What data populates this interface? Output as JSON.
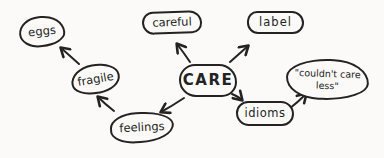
{
  "colors": {
    "ink": "#232323",
    "paper": "#fbfaf8"
  },
  "diagram": {
    "type": "mind-map",
    "center": "CARE",
    "nodes": {
      "care": {
        "label": "CARE"
      },
      "eggs": {
        "label": "eggs"
      },
      "careful": {
        "label": "careful"
      },
      "label": {
        "label": "label"
      },
      "fragile": {
        "label": "fragile"
      },
      "idioms": {
        "label": "idioms"
      },
      "feelings": {
        "label": "feelings"
      },
      "couldnt_care_less": {
        "line1": "\"couldn't care",
        "line2": "less\""
      }
    },
    "edges": [
      {
        "from": "CARE",
        "to": "careful"
      },
      {
        "from": "CARE",
        "to": "label"
      },
      {
        "from": "CARE",
        "to": "feelings"
      },
      {
        "from": "CARE",
        "to": "idioms"
      },
      {
        "from": "feelings",
        "to": "fragile"
      },
      {
        "from": "fragile",
        "to": "eggs"
      },
      {
        "from": "idioms",
        "to": "couldn't care less"
      }
    ]
  }
}
